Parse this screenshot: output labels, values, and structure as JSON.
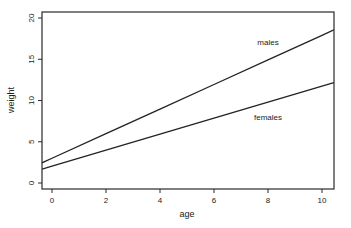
{
  "chart_data": {
    "type": "line",
    "title": "",
    "xlabel": "age",
    "ylabel": "weight",
    "xlim": [
      -0.37,
      10.44
    ],
    "ylim": [
      -0.7,
      20.7
    ],
    "xticks": [
      0,
      2,
      4,
      6,
      8,
      10
    ],
    "yticks": [
      0,
      5,
      10,
      15,
      20
    ],
    "grid": false,
    "legend": "none (inline annotations)",
    "series": [
      {
        "name": "males",
        "x": [
          -0.37,
          0,
          2,
          4,
          6,
          8,
          10,
          10.44
        ],
        "y": [
          2.45,
          3.0,
          5.98,
          8.96,
          11.94,
          14.92,
          17.9,
          18.56
        ],
        "color": "#222222",
        "label_position": {
          "x": 8.0,
          "y": 16.7
        }
      },
      {
        "name": "females",
        "x": [
          -0.37,
          0,
          2,
          4,
          6,
          8,
          10,
          10.44
        ],
        "y": [
          1.69,
          2.05,
          3.99,
          5.93,
          7.87,
          9.81,
          11.75,
          12.18
        ],
        "color": "#222222",
        "label_position": {
          "x": 8.0,
          "y": 7.6
        }
      }
    ],
    "annotations": [
      "males",
      "females"
    ]
  }
}
